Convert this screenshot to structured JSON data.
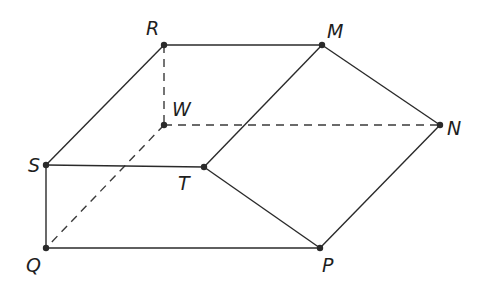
{
  "diagram": {
    "type": "3d-solid-prism",
    "vertices": {
      "R": {
        "label": "R",
        "x": 164,
        "y": 45,
        "lx": 146,
        "ly": 35
      },
      "M": {
        "label": "M",
        "x": 322,
        "y": 45,
        "lx": 327,
        "ly": 38
      },
      "W": {
        "label": "W",
        "x": 164,
        "y": 125,
        "lx": 172,
        "ly": 114
      },
      "N": {
        "label": "N",
        "x": 440,
        "y": 125,
        "lx": 447,
        "ly": 135
      },
      "S": {
        "label": "S",
        "x": 46,
        "y": 165,
        "lx": 28,
        "ly": 170
      },
      "T": {
        "label": "T",
        "x": 204,
        "y": 167,
        "lx": 178,
        "ly": 190
      },
      "Q": {
        "label": "Q",
        "x": 46,
        "y": 248,
        "lx": 26,
        "ly": 270
      },
      "P": {
        "label": "P",
        "x": 320,
        "y": 248,
        "lx": 322,
        "ly": 270
      }
    },
    "solid_edges": [
      [
        "R",
        "M"
      ],
      [
        "R",
        "S"
      ],
      [
        "M",
        "T"
      ],
      [
        "M",
        "N"
      ],
      [
        "S",
        "T"
      ],
      [
        "S",
        "Q"
      ],
      [
        "T",
        "P"
      ],
      [
        "N",
        "P"
      ],
      [
        "Q",
        "P"
      ]
    ],
    "hidden_edges": [
      [
        "R",
        "W"
      ],
      [
        "W",
        "N"
      ],
      [
        "W",
        "Q"
      ]
    ]
  }
}
